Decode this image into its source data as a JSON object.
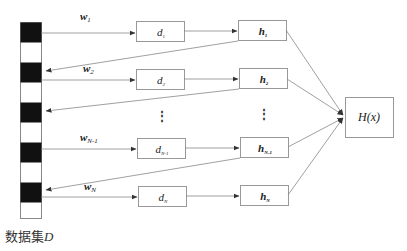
{
  "dataset": {
    "caption_prefix": "数据集",
    "caption_var": "D",
    "segments": 10,
    "black_color": "#111111"
  },
  "weights": [
    {
      "base": "w",
      "sub": "1"
    },
    {
      "base": "w",
      "sub": "2"
    },
    {
      "base": "w",
      "sub": "N-1"
    },
    {
      "base": "w",
      "sub": "N"
    }
  ],
  "datasets_boxes": [
    {
      "base": "d",
      "sub": "1"
    },
    {
      "base": "d",
      "sub": "2"
    },
    {
      "base": "d",
      "sub": "N-1"
    },
    {
      "base": "d",
      "sub": "N"
    }
  ],
  "learners": [
    {
      "base": "h",
      "sub": "1"
    },
    {
      "base": "h",
      "sub": "2"
    },
    {
      "base": "h",
      "sub": "N-1"
    },
    {
      "base": "h",
      "sub": "N"
    }
  ],
  "ellipsis": "⋮",
  "ensemble": {
    "label": "H(x)"
  },
  "colors": {
    "line": "#888888",
    "box_border": "#999999",
    "text": "#222222"
  }
}
